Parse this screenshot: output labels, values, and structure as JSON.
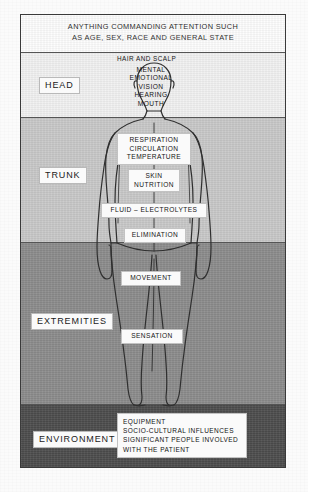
{
  "diagram": {
    "header": {
      "line1": "ANYTHING COMMANDING ATTENTION SUCH",
      "line2": "AS AGE, SEX, RACE AND GENERAL STATE"
    },
    "bands": [
      {
        "key": "head",
        "name": "HEAD",
        "color": "#f1f1f1"
      },
      {
        "key": "trunk",
        "name": "TRUNK",
        "color": "#c8c8c8"
      },
      {
        "key": "extremities",
        "name": "EXTREMITIES",
        "color": "#8b8b8b"
      },
      {
        "key": "environment",
        "name": "ENVIRONMENT",
        "color": "#4c4c4c"
      }
    ],
    "labels": {
      "hair_and_scalp": "HAIR AND SCALP",
      "head_items": {
        "mental": "MENTAL",
        "emotional": "EMOTIONAL",
        "vision": "VISION",
        "hearing": "HEARING",
        "mouth": "MOUTH"
      },
      "vitals": {
        "respiration": "RESPIRATION",
        "circulation": "CIRCULATION",
        "temperature": "TEMPERATURE"
      },
      "skin_nutrition": {
        "skin": "SKIN",
        "nutrition": "NUTRITION"
      },
      "fluid_electrolytes": "FLUID – ELECTROLYTES",
      "elimination": "ELIMINATION",
      "movement": "MOVEMENT",
      "sensation": "SENSATION",
      "environment_items": {
        "line1": "EQUIPMENT",
        "line2": "SOCIO-CULTURAL INFLUENCES",
        "line3": "SIGNIFICANT PEOPLE INVOLVED",
        "line4": "WITH THE PATIENT"
      }
    },
    "colors": {
      "page": "#fbfbfb",
      "frame_border": "#3a3a3a",
      "band_header": "#fdfdfd",
      "band_head": "#f1f1f1",
      "band_trunk": "#c8c8c8",
      "band_extremities": "#8b8b8b",
      "band_environment": "#4c4c4c",
      "figure_outline": "#2f2f2f",
      "label_box": "#fafafa",
      "text": "#141414"
    }
  }
}
